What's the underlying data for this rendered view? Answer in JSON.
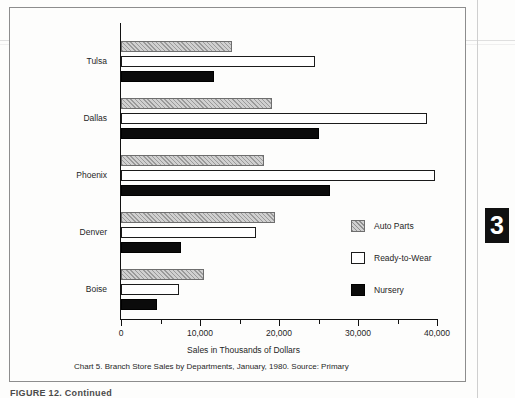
{
  "page": {
    "thumb_tab_label": "3",
    "bottom_cut_text": "FIGURE 12. Continued"
  },
  "caption": {
    "line1": "Chart 5.  Branch Store Sales by Departments, January, 1980.",
    "line2": "Source:  Primary"
  },
  "legend": {
    "position": "inside-right",
    "items": [
      {
        "label": "Auto Parts",
        "swatch": "hatched-gray"
      },
      {
        "label": "Ready-to-Wear",
        "swatch": "white-outline"
      },
      {
        "label": "Nursery",
        "swatch": "solid-black"
      }
    ]
  },
  "axis": {
    "x_title": "Sales in Thousands of Dollars",
    "x_ticks": [
      "0",
      "10,000",
      "20,000",
      "30,000",
      "40,000"
    ],
    "x_minor_ticks": [
      "5,000",
      "15,000",
      "25,000",
      "35,000"
    ]
  },
  "chart_data": {
    "type": "bar",
    "orientation": "horizontal",
    "title": "Chart 5.  Branch Store Sales by Departments, January, 1980.",
    "subtitle": "Source:  Primary",
    "xlabel": "Sales in Thousands of Dollars",
    "ylabel": "",
    "xlim": [
      0,
      40000
    ],
    "xticks": [
      0,
      10000,
      20000,
      30000,
      40000
    ],
    "xtick_labels": [
      "0",
      "10,000",
      "20,000",
      "30,000",
      "40,000"
    ],
    "grid": false,
    "legend_entries": [
      "Auto Parts",
      "Ready-to-Wear",
      "Nursery"
    ],
    "categories": [
      "Tulsa",
      "Dallas",
      "Phoenix",
      "Denver",
      "Boise"
    ],
    "series": [
      {
        "name": "Auto Parts",
        "values": [
          14100,
          19100,
          18100,
          19500,
          10500
        ]
      },
      {
        "name": "Ready-to-Wear",
        "values": [
          24600,
          38700,
          39700,
          17100,
          7300
        ]
      },
      {
        "name": "Nursery",
        "values": [
          11800,
          25000,
          26400,
          7600,
          4600
        ]
      }
    ]
  }
}
